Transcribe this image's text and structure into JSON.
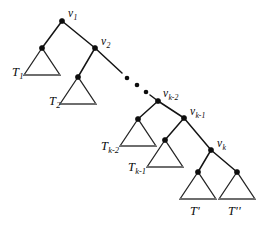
{
  "figure": {
    "kind": "binary-tree-diagram",
    "background_color": "#ffffff",
    "line_color": "#141414",
    "node_color": "#0d0d0d",
    "triangle_base_color": "#6e6e6e",
    "width": 266,
    "height": 232
  },
  "nodes": [
    {
      "id": "v1",
      "label": "v",
      "sub": "1",
      "x": 62,
      "y": 21,
      "label_x": 68,
      "label_y": 8
    },
    {
      "id": "v2",
      "label": "v",
      "sub": "2",
      "x": 95,
      "y": 48,
      "label_x": 101,
      "label_y": 36
    },
    {
      "id": "vk2",
      "label": "v",
      "sub": "k-2",
      "x": 158,
      "y": 101,
      "label_x": 163,
      "label_y": 88
    },
    {
      "id": "vk1",
      "label": "v",
      "sub": "k-1",
      "x": 184,
      "y": 118,
      "label_x": 190,
      "label_y": 106
    },
    {
      "id": "vk",
      "label": "v",
      "sub": "k",
      "x": 211,
      "y": 150,
      "label_x": 217,
      "label_y": 138
    }
  ],
  "subtrees": [
    {
      "id": "T1",
      "label": "T",
      "sub": "1",
      "apex_x": 42,
      "apex_y": 48,
      "half_width": 18,
      "height": 27,
      "label_x": 12,
      "label_y": 66
    },
    {
      "id": "T2",
      "label": "T",
      "sub": "2",
      "apex_x": 78,
      "apex_y": 77,
      "half_width": 18,
      "height": 27,
      "label_x": 49,
      "label_y": 95
    },
    {
      "id": "Tk2",
      "label": "T",
      "sub": "k-2",
      "apex_x": 138,
      "apex_y": 119,
      "half_width": 18,
      "height": 27,
      "label_x": 101,
      "label_y": 140
    },
    {
      "id": "Tk1",
      "label": "T",
      "sub": "k-1",
      "apex_x": 165,
      "apex_y": 140,
      "half_width": 18,
      "height": 27,
      "label_x": 128,
      "label_y": 161
    },
    {
      "id": "Tp",
      "label": "T",
      "prime": "'",
      "apex_x": 198,
      "apex_y": 172,
      "half_width": 18,
      "height": 27,
      "label_x": 190,
      "label_y": 205
    },
    {
      "id": "Tpp",
      "label": "T",
      "prime": "''",
      "apex_x": 237,
      "apex_y": 172,
      "half_width": 18,
      "height": 27,
      "label_x": 228,
      "label_y": 205
    }
  ],
  "edges": [
    {
      "id": "e-v1-T1",
      "from": "v1",
      "to": "T1",
      "x1": 62,
      "y1": 21,
      "x2": 42,
      "y2": 48
    },
    {
      "id": "e-v1-v2",
      "from": "v1",
      "to": "v2",
      "x1": 62,
      "y1": 21,
      "x2": 95,
      "y2": 48
    },
    {
      "id": "e-v2-T2",
      "from": "v2",
      "to": "T2",
      "x1": 95,
      "y1": 48,
      "x2": 78,
      "y2": 77
    },
    {
      "id": "e-v2-dots",
      "from": "v2",
      "to": "ellipsis",
      "x1": 95,
      "y1": 48,
      "x2": 122,
      "y2": 73
    },
    {
      "id": "e-dots-vk2",
      "from": "ellipsis",
      "to": "vk2",
      "x1": 150,
      "y1": 95,
      "x2": 158,
      "y2": 101
    },
    {
      "id": "e-vk2-Tk2",
      "from": "vk2",
      "to": "Tk2",
      "x1": 158,
      "y1": 101,
      "x2": 138,
      "y2": 119
    },
    {
      "id": "e-vk2-vk1",
      "from": "vk2",
      "to": "vk1",
      "x1": 158,
      "y1": 101,
      "x2": 184,
      "y2": 118
    },
    {
      "id": "e-vk1-Tk1",
      "from": "vk1",
      "to": "Tk1",
      "x1": 184,
      "y1": 118,
      "x2": 165,
      "y2": 140
    },
    {
      "id": "e-vk1-vk",
      "from": "vk1",
      "to": "vk",
      "x1": 184,
      "y1": 118,
      "x2": 211,
      "y2": 150
    },
    {
      "id": "e-vk-Tp",
      "from": "vk",
      "to": "Tp",
      "x1": 211,
      "y1": 150,
      "x2": 198,
      "y2": 172
    },
    {
      "id": "e-vk-Tpp",
      "from": "vk",
      "to": "Tpp",
      "x1": 211,
      "y1": 150,
      "x2": 237,
      "y2": 172
    }
  ],
  "ellipsis": {
    "label": "...",
    "dots": [
      {
        "x": 127,
        "y": 78,
        "r": 2.3
      },
      {
        "x": 137,
        "y": 85,
        "r": 2.3
      },
      {
        "x": 146,
        "y": 92,
        "r": 2.3
      }
    ]
  }
}
